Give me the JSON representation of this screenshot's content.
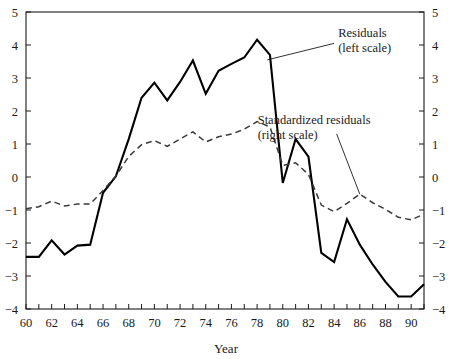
{
  "chart_data": {
    "type": "line",
    "title": "",
    "xlabel": "Year",
    "ylabel": "",
    "xlim": [
      60,
      91
    ],
    "ylim": [
      -4,
      5
    ],
    "grid": false,
    "legend_position": "inline-annotations",
    "x": [
      60,
      61,
      62,
      63,
      64,
      65,
      66,
      67,
      68,
      69,
      70,
      71,
      72,
      73,
      74,
      75,
      76,
      77,
      78,
      79,
      80,
      81,
      82,
      83,
      84,
      85,
      86,
      87,
      88,
      89,
      90,
      91
    ],
    "x_tick_labels": [
      "60",
      "62",
      "64",
      "66",
      "68",
      "70",
      "72",
      "74",
      "76",
      "78",
      "80",
      "82",
      "84",
      "86",
      "88",
      "90"
    ],
    "x_tick_values": [
      60,
      62,
      64,
      66,
      68,
      70,
      72,
      74,
      76,
      78,
      80,
      82,
      84,
      86,
      88,
      90
    ],
    "y_tick_labels_left": [
      "5",
      "4",
      "3",
      "2",
      "1",
      "0",
      "-1",
      "-2",
      "-3",
      "-4"
    ],
    "y_tick_labels_right": [
      "5",
      "4",
      "3",
      "2",
      "1",
      "0",
      "-1",
      "-2",
      "-3",
      "-4"
    ],
    "y_tick_values": [
      5,
      4,
      3,
      2,
      1,
      0,
      -1,
      -2,
      -3,
      -4
    ],
    "series": [
      {
        "name": "Residuals (left scale)",
        "axis": "left",
        "style": "solid",
        "color": "#000000",
        "values": [
          -2.42,
          -2.42,
          -1.92,
          -2.35,
          -2.08,
          -2.05,
          -0.48,
          0.02,
          1.15,
          2.4,
          2.86,
          2.32,
          2.88,
          3.53,
          2.52,
          3.22,
          3.43,
          3.62,
          4.16,
          3.7,
          -0.18,
          1.15,
          0.62,
          -2.3,
          -2.58,
          -1.28,
          -2.05,
          -2.65,
          -3.18,
          -3.62,
          -3.62,
          -3.25
        ]
      },
      {
        "name": "Standardized residuals (right scale)",
        "axis": "right",
        "style": "dashed",
        "color": "#3a3a3a",
        "values": [
          -0.96,
          -0.9,
          -0.73,
          -0.88,
          -0.82,
          -0.82,
          -0.41,
          0.03,
          0.62,
          0.98,
          1.1,
          0.93,
          1.15,
          1.37,
          1.06,
          1.22,
          1.3,
          1.45,
          1.68,
          1.52,
          0.35,
          0.43,
          0.08,
          -0.85,
          -1.05,
          -0.8,
          -0.52,
          -0.78,
          -0.98,
          -1.22,
          -1.3,
          -1.12
        ]
      }
    ],
    "annotations": [
      {
        "id": "residuals-annotation",
        "line1": "Residuals",
        "line2": "(left scale)",
        "leader_from_x": 78.8,
        "leader_from_y": 3.55,
        "leader_to_x": 84.0,
        "leader_to_y": 4.05
      },
      {
        "id": "standardized-residuals-annotation",
        "line1": "Standardized residuals",
        "line2": "(right scale)",
        "leader_from_x": 86.0,
        "leader_from_y": -0.52,
        "leader_to_x": 84.2,
        "leader_to_y": 1.3
      }
    ]
  }
}
